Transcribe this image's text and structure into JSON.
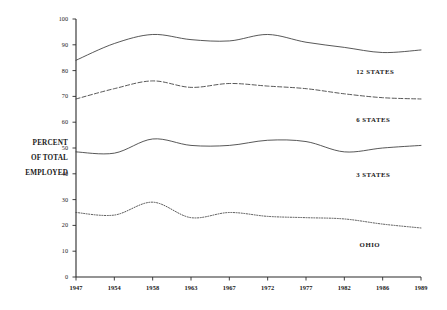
{
  "chart_data": {
    "type": "line",
    "title": "",
    "xlabel": "",
    "ylabel": "PERCENT OF TOTAL EMPLOYED",
    "ylabel_lines": [
      "PERCENT",
      "OF TOTAL",
      "EMPLOYED"
    ],
    "categories": [
      "1947",
      "1954",
      "1958",
      "1963",
      "1967",
      "1972",
      "1977",
      "1982",
      "1986",
      "1989"
    ],
    "x": [
      1947,
      1954,
      1958,
      1963,
      1967,
      1972,
      1977,
      1982,
      1986,
      1989
    ],
    "ylim": [
      0,
      100
    ],
    "yticks": [
      "0",
      "10",
      "20",
      "30",
      "40",
      "50",
      "60",
      "70",
      "80",
      "90",
      "100"
    ],
    "ytick_values": [
      0,
      10,
      20,
      30,
      40,
      50,
      60,
      70,
      80,
      90,
      100
    ],
    "grid": false,
    "legend_position": "inline-right",
    "series": [
      {
        "name": "12 STATES",
        "style": "solid",
        "color": "#3a3a3a",
        "label_x_pct": 87,
        "label_y_value": 79.5,
        "values": [
          84.0,
          90.5,
          94.0,
          92.0,
          91.5,
          94.0,
          91.0,
          89.0,
          87.0,
          88.0
        ]
      },
      {
        "name": "6 STATES",
        "style": "dashed",
        "color": "#3a3a3a",
        "label_x_pct": 87,
        "label_y_value": 61.0,
        "values": [
          69.0,
          73.0,
          76.0,
          73.5,
          75.0,
          74.0,
          73.0,
          71.0,
          69.5,
          69.0
        ]
      },
      {
        "name": "3 STATES",
        "style": "solid",
        "color": "#3a3a3a",
        "label_x_pct": 87,
        "label_y_value": 39.5,
        "values": [
          48.5,
          48.0,
          53.5,
          51.0,
          51.0,
          53.0,
          52.5,
          48.5,
          50.0,
          51.0
        ]
      },
      {
        "name": "OHIO",
        "style": "dotted",
        "color": "#3a3a3a",
        "label_x_pct": 88,
        "label_y_value": 12.5,
        "values": [
          25.0,
          24.0,
          29.0,
          23.0,
          25.0,
          23.5,
          23.0,
          22.5,
          20.5,
          19.0
        ]
      }
    ]
  }
}
